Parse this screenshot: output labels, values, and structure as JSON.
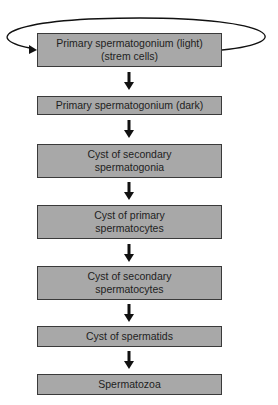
{
  "diagram": {
    "type": "flowchart",
    "direction": "top-to-bottom",
    "colors": {
      "box_fill": "#a8a8a8",
      "box_border": "#3a3a3a",
      "text": "#1e1e1e",
      "arrow": "#111111",
      "background": "#ffffff"
    },
    "nodes": [
      {
        "id": "n1",
        "label": "Primary spermatogonium (light)\n(strem cells)"
      },
      {
        "id": "n2",
        "label": "Primary spermatogonium (dark)"
      },
      {
        "id": "n3",
        "label": "Cyst of secondary\nspermatogonia"
      },
      {
        "id": "n4",
        "label": "Cyst of primary\nspermatocytes"
      },
      {
        "id": "n5",
        "label": "Cyst of secondary\nspermatocytes"
      },
      {
        "id": "n6",
        "label": "Cyst of spermatids"
      },
      {
        "id": "n7",
        "label": "Spermatozoa"
      }
    ],
    "edges": [
      {
        "from": "n1",
        "to": "n1",
        "style": "self-loop"
      },
      {
        "from": "n1",
        "to": "n2"
      },
      {
        "from": "n2",
        "to": "n3"
      },
      {
        "from": "n3",
        "to": "n4"
      },
      {
        "from": "n4",
        "to": "n5"
      },
      {
        "from": "n5",
        "to": "n6"
      },
      {
        "from": "n6",
        "to": "n7"
      }
    ]
  }
}
